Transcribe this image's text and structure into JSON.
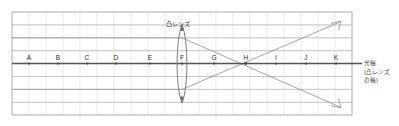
{
  "diagram": {
    "lens": {
      "label": "凸レンズ",
      "position_letter": "F",
      "icon": "convex-lens-icon"
    },
    "axis": {
      "caption_lines": [
        "光軸",
        "(凸レンズ",
        "の軸)"
      ],
      "points": [
        {
          "label": "A"
        },
        {
          "label": "B"
        },
        {
          "label": "C"
        },
        {
          "label": "D"
        },
        {
          "label": "E"
        },
        {
          "label": "F"
        },
        {
          "label": "G"
        },
        {
          "label": "H"
        },
        {
          "label": "I"
        },
        {
          "label": "J"
        },
        {
          "label": "K"
        }
      ]
    },
    "rays": {
      "focus_letter": "H",
      "incoming_upper": "horizontal-ray-upper",
      "incoming_lower": "horizontal-ray-lower",
      "outgoing_upper": "refracted-ray-up-arrow",
      "outgoing_lower": "refracted-ray-down-arrow"
    },
    "colors": {
      "grid_minor": "#d9d9d9",
      "grid_major": "#b9b9b9",
      "grid_border": "#b0b0b0",
      "axis": "#555555",
      "ray": "#8a8a8a",
      "lens": "#777777",
      "text": "#3a3a3a",
      "background": "#ffffff"
    }
  }
}
